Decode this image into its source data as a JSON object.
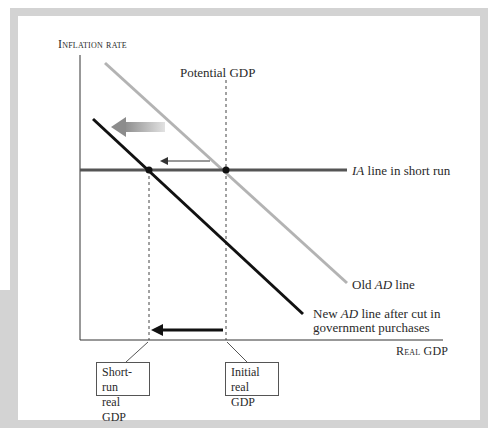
{
  "diagram": {
    "y_axis_label": "Inflation rate",
    "x_axis_label": "Real GDP",
    "potential_gdp_label": "Potential GDP",
    "ia_line": {
      "prefix": "IA",
      "suffix": " line in short run",
      "color": "#555555"
    },
    "old_ad_line": {
      "prefix": "Old ",
      "italic": "AD",
      "suffix": " line",
      "color": "#b3b3b3"
    },
    "new_ad_line": {
      "line1_prefix": "New ",
      "line1_italic": "AD",
      "line1_suffix": " line after cut in",
      "line2": "government purchases",
      "color": "#111111"
    },
    "boxes": [
      {
        "line1": "Short-run",
        "line2": "real GDP"
      },
      {
        "line1": "Initial",
        "line2": "real GDP"
      }
    ],
    "arrows": [
      {
        "name": "ad-shift-arrow",
        "direction": "left",
        "style": "wide gradient gray"
      },
      {
        "name": "inflation-path-arrow",
        "direction": "left",
        "style": "thin dark gray"
      },
      {
        "name": "gdp-decline-arrow",
        "direction": "left",
        "style": "thick black"
      }
    ],
    "points": [
      {
        "name": "initial-equilibrium",
        "description": "Old AD intersects IA at potential GDP"
      },
      {
        "name": "short-run-equilibrium",
        "description": "New AD intersects IA at short-run real GDP"
      }
    ],
    "frame_color": "#d3d3d3"
  }
}
